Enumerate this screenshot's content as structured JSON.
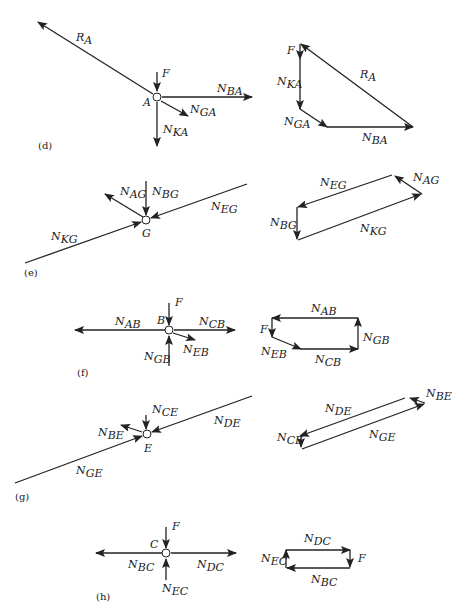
{
  "figure": {
    "panels": [
      {
        "id": "d",
        "caption": "(d)",
        "node": "A",
        "fbd_labels": {
          "RA": [
            "R",
            "A"
          ],
          "F": [
            "F",
            ""
          ],
          "NBA": [
            "N",
            "BA"
          ],
          "NGA": [
            "N",
            "GA"
          ],
          "NKA": [
            "N",
            "KA"
          ]
        },
        "polygon_labels": {
          "F": [
            "F",
            ""
          ],
          "NKA": [
            "N",
            "KA"
          ],
          "NGA": [
            "N",
            "GA"
          ],
          "NBA": [
            "N",
            "BA"
          ],
          "RA": [
            "R",
            "A"
          ]
        }
      },
      {
        "id": "e",
        "caption": "(e)",
        "node": "G",
        "fbd_labels": {
          "NAG": [
            "N",
            "AG"
          ],
          "NBG": [
            "N",
            "BG"
          ],
          "NEG": [
            "N",
            "EG"
          ],
          "NKG": [
            "N",
            "KG"
          ]
        },
        "polygon_labels": {
          "NEG": [
            "N",
            "EG"
          ],
          "NAG": [
            "N",
            "AG"
          ],
          "NBG": [
            "N",
            "BG"
          ],
          "NKG": [
            "N",
            "KG"
          ]
        }
      },
      {
        "id": "f",
        "caption": "(f)",
        "node": "B",
        "fbd_labels": {
          "F": [
            "F",
            ""
          ],
          "NAB": [
            "N",
            "AB"
          ],
          "NCB": [
            "N",
            "CB"
          ],
          "NEB": [
            "N",
            "EB"
          ],
          "NGB": [
            "N",
            "GB"
          ]
        },
        "polygon_labels": {
          "NAB": [
            "N",
            "AB"
          ],
          "F": [
            "F",
            ""
          ],
          "NEB": [
            "N",
            "EB"
          ],
          "NCB": [
            "N",
            "CB"
          ],
          "NGB": [
            "N",
            "GB"
          ]
        }
      },
      {
        "id": "g",
        "caption": "(g)",
        "node": "E",
        "fbd_labels": {
          "NCE": [
            "N",
            "CE"
          ],
          "NBE": [
            "N",
            "BE"
          ],
          "NDE": [
            "N",
            "DE"
          ],
          "NGE": [
            "N",
            "GE"
          ]
        },
        "polygon_labels": {
          "NDE": [
            "N",
            "DE"
          ],
          "NBE": [
            "N",
            "BE"
          ],
          "NCE": [
            "N",
            "CE"
          ],
          "NGE": [
            "N",
            "GE"
          ]
        }
      },
      {
        "id": "h",
        "caption": "(h)",
        "node": "C",
        "fbd_labels": {
          "F": [
            "F",
            ""
          ],
          "NBC": [
            "N",
            "BC"
          ],
          "NDC": [
            "N",
            "DC"
          ],
          "NEC": [
            "N",
            "EC"
          ]
        },
        "polygon_labels": {
          "NDC": [
            "N",
            "DC"
          ],
          "F": [
            "F",
            ""
          ],
          "NEC": [
            "N",
            "EC"
          ],
          "NBC": [
            "N",
            "BC"
          ]
        }
      }
    ]
  },
  "style": {
    "line_color": "#222222",
    "background": "#ffffff"
  }
}
